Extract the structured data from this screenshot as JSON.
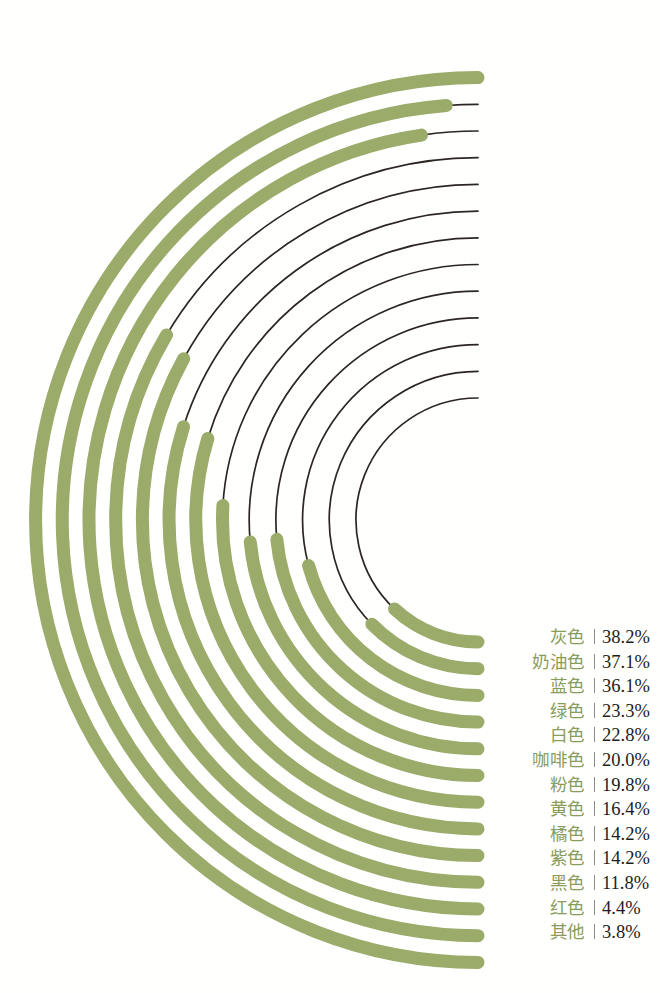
{
  "chart_data": {
    "type": "bar",
    "title": "",
    "xlabel": "",
    "ylabel": "",
    "layout": {
      "style": "radial-bar",
      "grid": false,
      "legend_position": "right",
      "track_color": "#2b2622",
      "bar_color": "#9aab6a",
      "value_suffix": "%",
      "value_max": 100,
      "center_x": 478,
      "center_y": 520,
      "inner_radius": 122,
      "ring_spacing": 26.7,
      "bar_thickness": 13
    },
    "categories": [
      "灰色",
      "奶油色",
      "蓝色",
      "绿色",
      "白色",
      "咖啡色",
      "粉色",
      "黄色",
      "橘色",
      "紫色",
      "黑色",
      "红色",
      "其他"
    ],
    "values": [
      38.2,
      37.1,
      36.1,
      23.3,
      22.8,
      20.0,
      19.8,
      16.4,
      14.2,
      14.2,
      11.8,
      4.4,
      3.8
    ]
  },
  "legend": {
    "rows": [
      {
        "name": "灰色",
        "value": "38.2%"
      },
      {
        "name": "奶油色",
        "value": "37.1%"
      },
      {
        "name": "蓝色",
        "value": "36.1%"
      },
      {
        "name": "绿色",
        "value": "23.3%"
      },
      {
        "name": "白色",
        "value": "22.8%"
      },
      {
        "name": "咖啡色",
        "value": "20.0%"
      },
      {
        "name": "粉色",
        "value": "19.8%"
      },
      {
        "name": "黄色",
        "value": "16.4%"
      },
      {
        "name": "橘色",
        "value": "14.2%"
      },
      {
        "name": "紫色",
        "value": "14.2%"
      },
      {
        "name": "黑色",
        "value": "11.8%"
      },
      {
        "name": "红色",
        "value": "4.4%"
      },
      {
        "name": "其他",
        "value": "3.8%"
      }
    ]
  }
}
